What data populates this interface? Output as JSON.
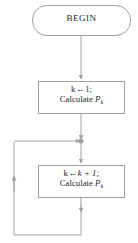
{
  "diagram": {
    "type": "flowchart",
    "title": "",
    "background_color": "#ffffff",
    "line_color": "#a0a0a0",
    "text_color": "#231f20",
    "nodes": [
      {
        "id": "begin",
        "shape": "rounded-terminator",
        "label": "BEGIN",
        "lines": [
          "BEGIN"
        ]
      },
      {
        "id": "init",
        "shape": "rectangle",
        "lines": [
          "k ← 1;",
          "Calculate P"
        ],
        "line1_var": "k",
        "line1_arrow": "←",
        "line1_value": "1;",
        "line2_text": "Calculate",
        "line2_symbol": "P",
        "line2_subscript": "k"
      },
      {
        "id": "increment",
        "shape": "rectangle",
        "lines": [
          "k ← k + 1;",
          "Calculate P"
        ],
        "line1_var": "k",
        "line1_arrow": "←",
        "line1_value": "k + 1;",
        "line2_text": "Calculate",
        "line2_symbol": "P",
        "line2_subscript": "k"
      }
    ],
    "edges": [
      {
        "id": "begin-to-init",
        "from": "begin",
        "to": "init",
        "arrow": true,
        "direction": "down"
      },
      {
        "id": "init-to-junction",
        "from": "init",
        "to": "junction",
        "arrow": true,
        "direction": "down"
      },
      {
        "id": "junction-to-increment",
        "from": "junction",
        "to": "increment",
        "arrow": true,
        "direction": "down"
      },
      {
        "id": "increment-loop-back",
        "from": "increment",
        "to": "junction",
        "arrow": true,
        "direction": "loop-left-up"
      }
    ],
    "junction": {
      "id": "junction-dot",
      "shape": "dot"
    }
  }
}
